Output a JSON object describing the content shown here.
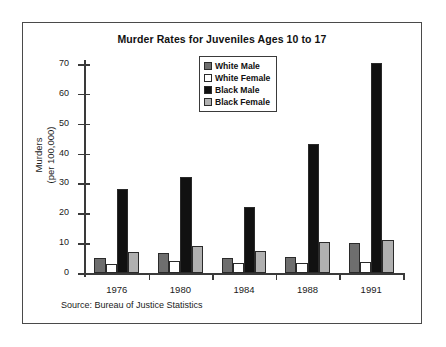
{
  "chart_data": {
    "type": "bar",
    "title": "Murder Rates for Juveniles Ages 10 to 17",
    "xlabel": "",
    "ylabel": "Murders\n(per 100,000)",
    "ylabel_line1": "Murders",
    "ylabel_line2": "(per 100,000)",
    "categories": [
      "1976",
      "1980",
      "1984",
      "1988",
      "1991"
    ],
    "ylim": [
      0,
      70
    ],
    "yticks": [
      0,
      10,
      20,
      30,
      40,
      50,
      60,
      70
    ],
    "ytick_labels": [
      "0",
      "10",
      "20",
      "30",
      "40",
      "50",
      "60",
      "70"
    ],
    "grid": false,
    "legend_position": "top-center",
    "series": [
      {
        "name": "White Male",
        "color": "#6e6e6e",
        "values": [
          5.0,
          6.8,
          5.0,
          5.5,
          10.2
        ]
      },
      {
        "name": "White Female",
        "color": "#ffffff",
        "values": [
          2.9,
          3.9,
          3.3,
          3.5,
          3.6
        ]
      },
      {
        "name": "Black Male",
        "color": "#111111",
        "values": [
          28.0,
          32.0,
          22.0,
          43.3,
          70.3
        ]
      },
      {
        "name": "Black Female",
        "color": "#b0b0b0",
        "values": [
          7.0,
          9.2,
          7.4,
          10.5,
          11.2
        ]
      }
    ],
    "annotations": [
      "Source: Bureau of Justice Statistics"
    ]
  },
  "figure": {
    "title": "Murder Rates for Juveniles Ages 10 to 17",
    "source_note": "Source: Bureau of Justice Statistics",
    "axis": {
      "y_title_line1": "Murders",
      "y_title_line2": "(per 100,000)"
    }
  }
}
